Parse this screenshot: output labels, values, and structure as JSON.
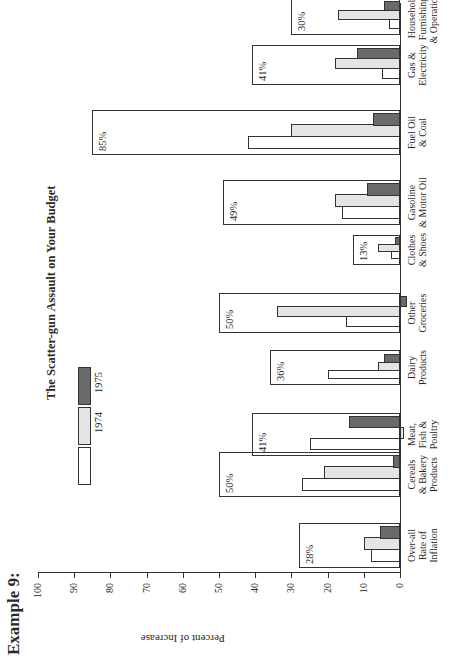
{
  "example_label": "Example 9:",
  "chart_data": {
    "type": "bar",
    "title": "The Scatter-gun Assault on Your Budget",
    "xlabel": "",
    "ylabel": "Percent of Increase",
    "ylim": [
      0,
      100
    ],
    "yticks": [
      0,
      10,
      20,
      30,
      40,
      50,
      60,
      70,
      80,
      90,
      100
    ],
    "grid": false,
    "orientation_note": "rendered rotated 90 degrees counter-clockwise",
    "categories": [
      "Over-all Rate of Inflation",
      "Cereals & Bakery Products",
      "Meat, Fish & Poultry",
      "Dairy Products",
      "Other Groceries",
      "Clothes & Shoes",
      "Gasoline & Motor Oil",
      "Fuel Oil & Coal",
      "Gas & Electricity",
      "Household Furnishings & Operations"
    ],
    "cumulative_totals": [
      28,
      50,
      41,
      36,
      50,
      13,
      49,
      85,
      41,
      30
    ],
    "cumulative_labels": [
      "28%",
      "50%",
      "41%",
      "36%",
      "50%",
      "13%",
      "49%",
      "85%",
      "41%",
      "30%"
    ],
    "series": [
      {
        "name": "(unlabeled)",
        "style": "white",
        "values": [
          8,
          27,
          25,
          20,
          15,
          2.5,
          16,
          42,
          5,
          3
        ]
      },
      {
        "name": "1974",
        "style": "light-gray",
        "values": [
          10,
          21,
          -1,
          6,
          34,
          6,
          18,
          30,
          18,
          17
        ]
      },
      {
        "name": "1975",
        "style": "dark-gray",
        "values": [
          5.5,
          2,
          14,
          4.5,
          -2,
          1.5,
          9,
          7.5,
          12,
          4.5
        ]
      }
    ],
    "legend": {
      "position": "top-left of plot",
      "entries": [
        {
          "label": "",
          "style": "white"
        },
        {
          "label": "1974",
          "style": "light-gray"
        },
        {
          "label": "1975",
          "style": "dark-gray"
        }
      ]
    }
  },
  "category_lines": [
    [
      "Over-all",
      "Rate of",
      "Inflation"
    ],
    [
      "Cereals",
      "& Bakery",
      "Products"
    ],
    [
      "Meat,",
      "Fish &",
      "Poultry"
    ],
    [
      "Dairy",
      "Products"
    ],
    [
      "Other",
      "Groceries"
    ],
    [
      "Clothes",
      "& Shoes"
    ],
    [
      "Gasoline",
      "& Motor Oil"
    ],
    [
      "Fuel Oil",
      "& Coal"
    ],
    [
      "Gas &",
      "Electricity"
    ],
    [
      "Household",
      "Furnishings",
      "& Operations"
    ]
  ],
  "layout": {
    "group_left": [
      97,
      168,
      209,
      280,
      332,
      400,
      440,
      510,
      580,
      630
    ],
    "group_width": [
      45,
      45,
      43,
      35,
      40,
      30,
      45,
      45,
      40,
      37
    ]
  }
}
